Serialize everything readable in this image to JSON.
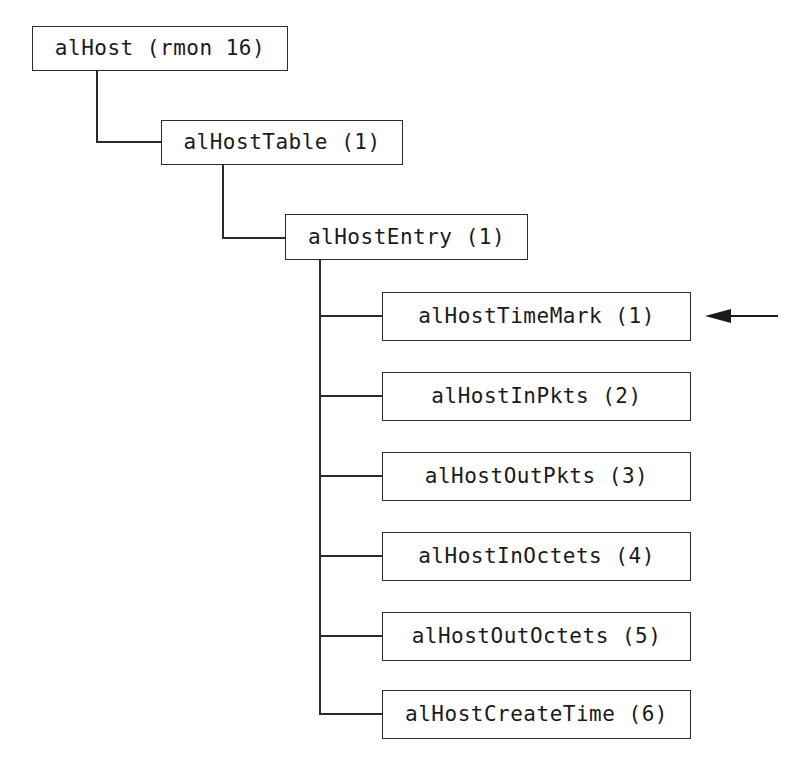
{
  "diagram": {
    "type": "tree",
    "background_color": "#ffffff",
    "line_color": "#2b2b2b",
    "text_color": "#1a1a1a",
    "nodes": {
      "root": {
        "label": "alHost (rmon 16)"
      },
      "table": {
        "label": "alHostTable (1)"
      },
      "entry": {
        "label": "alHostEntry (1)"
      }
    },
    "leaves": [
      {
        "label": "alHostTimeMark (1)",
        "top": 292,
        "stub_top": 315,
        "annotated": true
      },
      {
        "label": "alHostInPkts (2)",
        "top": 372,
        "stub_top": 395,
        "annotated": false
      },
      {
        "label": "alHostOutPkts (3)",
        "top": 452,
        "stub_top": 475,
        "annotated": false
      },
      {
        "label": "alHostInOctets (4)",
        "top": 532,
        "stub_top": 555,
        "annotated": false
      },
      {
        "label": "alHostOutOctets (5)",
        "top": 612,
        "stub_top": 635,
        "annotated": false
      },
      {
        "label": "alHostCreateTime (6)",
        "top": 690,
        "stub_top": 713,
        "annotated": false
      }
    ],
    "annotation": {
      "name": "left-arrow-pointer",
      "points_to": "alHostTimeMark (1)",
      "direction": "left"
    }
  }
}
